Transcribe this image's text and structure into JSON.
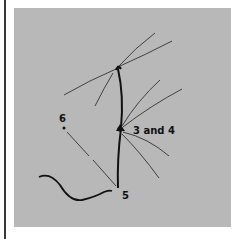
{
  "figure": {
    "background_color": "#b8b8b8",
    "line_color": "#1a1a1a",
    "thin_line_color": "#333333",
    "labels": {
      "node_3_and_4": "3 and 4",
      "point_6": "6",
      "point_5": "5"
    }
  }
}
